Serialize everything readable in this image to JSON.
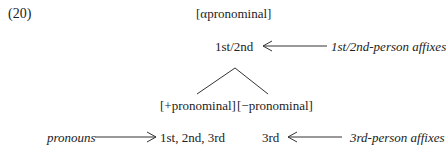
{
  "example_number": "(20)",
  "root": "[αpronominal]",
  "node_1st2nd": "1st/2nd",
  "label_1st2nd_affixes": "1st/2nd-person affixes",
  "branch_plus": "[+pronominal]",
  "branch_minus": "[−pronominal]",
  "label_pronouns": "pronouns",
  "node_all_persons": "1st, 2nd, 3rd",
  "node_3rd": "3rd",
  "label_3rd_affixes": "3rd-person affixes",
  "colors": {
    "text": "#222222",
    "lines": "#333333"
  }
}
